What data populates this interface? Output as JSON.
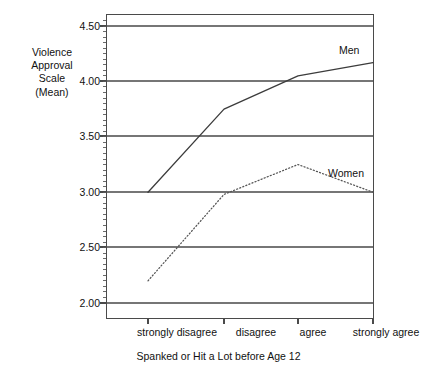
{
  "chart_data": {
    "type": "line",
    "title": "",
    "xlabel": "Spanked or Hit a Lot before Age 12",
    "ylabel": "Violence Approval Scale (Mean)",
    "categories": [
      "strongly disagree",
      "disagree",
      "agree",
      "strongly agree"
    ],
    "ylim": [
      1.88,
      4.62
    ],
    "yticks": [
      "2.00",
      "2.50",
      "3.00",
      "3.50",
      "4.00",
      "4.50"
    ],
    "ytick_values": [
      2.0,
      2.5,
      3.0,
      3.5,
      4.0,
      4.5
    ],
    "grid": true,
    "grid_axis": "y",
    "minor_ticks_axis": "y",
    "legend": "inline-labels",
    "series": [
      {
        "name": "Men",
        "style": "solid",
        "color": "#3c3c3c",
        "values": [
          3.0,
          3.75,
          4.05,
          4.17
        ]
      },
      {
        "name": "Women",
        "style": "dotted",
        "color": "#555555",
        "values": [
          2.2,
          2.98,
          3.25,
          3.0
        ]
      }
    ]
  },
  "ylabel_lines": [
    "Violence",
    "Approval",
    "Scale",
    "(Mean)"
  ],
  "axis": {
    "ytick_labels": [
      "4.50",
      "4.00",
      "3.50",
      "3.00",
      "2.50",
      "2.00"
    ],
    "xtick_labels": [
      "strongly disagree",
      "disagree",
      "agree",
      "strongly agree"
    ],
    "x_title": "Spanked or Hit a Lot before Age 12"
  },
  "series_labels": {
    "men": "Men",
    "women": "Women"
  },
  "colors": {
    "axis": "#4a4a4a",
    "grid": "#767676",
    "men_line": "#3c3c3c",
    "women_line": "#5a5a5a",
    "text": "#111111",
    "background": "#ffffff"
  }
}
